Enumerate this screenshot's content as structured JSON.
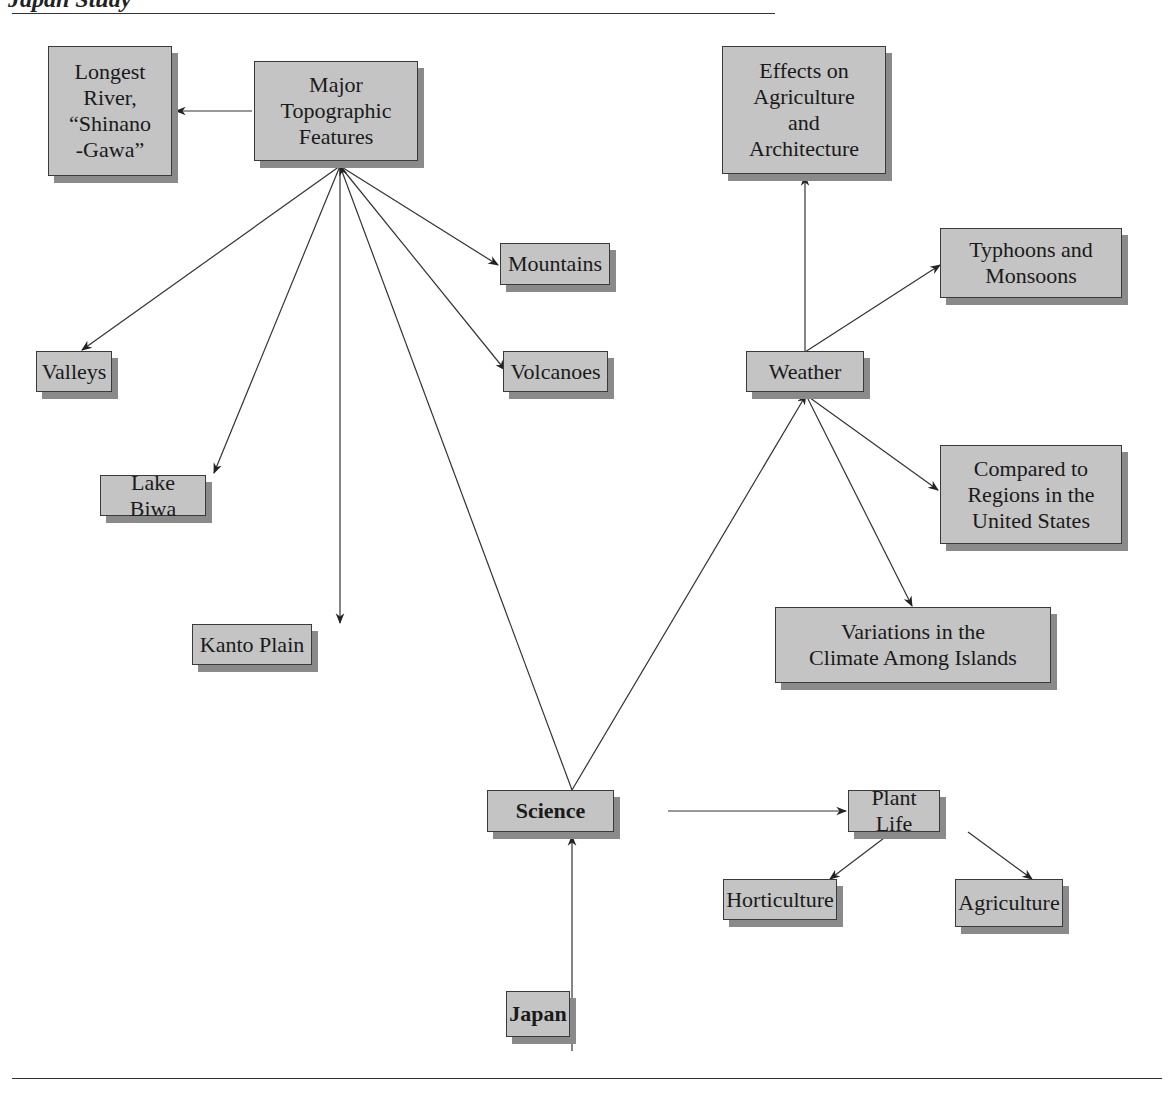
{
  "header": {
    "title_fragment": "Japan Study"
  },
  "colors": {
    "node_fill": "#c4c4c4",
    "node_border": "#3a3a3a",
    "shadow": "#8a8a8a",
    "line": "#333333"
  },
  "nodes": {
    "longest_river": "Longest\nRiver,\n“Shinano\n-Gawa”",
    "major_topographic": "Major\nTopographic\nFeatures",
    "effects": "Effects on\nAgriculture\nand\nArchitecture",
    "typhoons": "Typhoons and\nMonsoons",
    "mountains": "Mountains",
    "valleys": "Valleys",
    "volcanoes": "Volcanoes",
    "weather": "Weather",
    "lake_biwa": "Lake Biwa",
    "compared": "Compared to\nRegions in the\nUnited States",
    "kanto": "Kanto Plain",
    "variations": "Variations in the\nClimate Among Islands",
    "science": "Science",
    "plant_life": "Plant Life",
    "horticulture": "Horticulture",
    "agriculture": "Agriculture",
    "japan": "Japan"
  }
}
